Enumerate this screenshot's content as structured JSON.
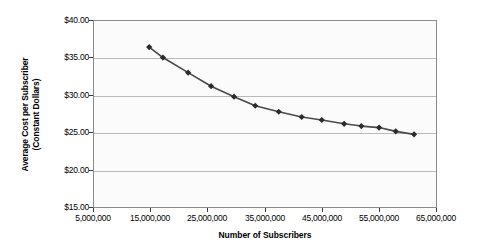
{
  "chart_data": {
    "type": "line",
    "title": "",
    "xlabel": "Number of Subscribers",
    "ylabel": "Average Cost per Subscriber (Constant Dollars)",
    "ylabel_line1": "Average Cost per Subscriber",
    "ylabel_line2": "(Constant Dollars)",
    "xlim": [
      5000000,
      65000000
    ],
    "ylim": [
      15,
      40
    ],
    "xticks": [
      5000000,
      15000000,
      25000000,
      35000000,
      45000000,
      55000000,
      65000000
    ],
    "xtick_labels": [
      "5,000,000",
      "15,000,000",
      "25,000,000",
      "35,000,000",
      "45,000,000",
      "55,000,000",
      "65,000,000"
    ],
    "yticks": [
      15,
      20,
      25,
      30,
      35,
      40
    ],
    "ytick_labels": [
      "$15.00",
      "$20.00",
      "$25.00",
      "$30.00",
      "$35.00",
      "$40.00"
    ],
    "grid": true,
    "legend": false,
    "marker": "diamond",
    "marker_color": "#2b2b2b",
    "line_color": "#4a4a4a",
    "plot_background": "#fbfbfb",
    "series": [
      {
        "name": "Average Cost per Subscriber",
        "x": [
          14800000,
          17200000,
          21600000,
          25600000,
          29600000,
          33300000,
          37400000,
          41400000,
          44900000,
          48800000,
          51800000,
          54900000,
          57800000,
          61000000
        ],
        "y": [
          36.4,
          35.0,
          33.0,
          31.2,
          29.8,
          28.6,
          27.8,
          27.1,
          26.7,
          26.2,
          25.9,
          25.7,
          25.2,
          24.8
        ]
      }
    ]
  }
}
